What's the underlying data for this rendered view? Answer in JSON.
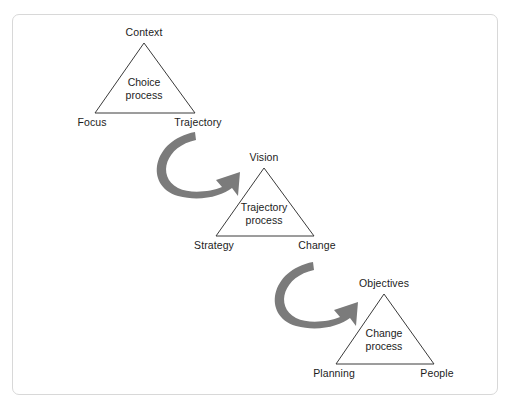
{
  "figure": {
    "background_color": "#ffffff",
    "frame_color": "#d8d8d8",
    "triangle_stroke_color": "#3a3a3a",
    "arrow_color": "#7b7b7b",
    "text_color": "#1c1c1c"
  },
  "diagram": {
    "type": "process-flow-triangles",
    "stages": [
      {
        "id": "choice",
        "inner_label_line1": "Choice",
        "inner_label_line2": "process",
        "apex_label": "Context",
        "bottom_left_label": "Focus",
        "bottom_right_label": "Trajectory",
        "apex": {
          "x": 144,
          "y": 43
        },
        "bottom_left": {
          "x": 95,
          "y": 113
        },
        "bottom_right": {
          "x": 195,
          "y": 113
        }
      },
      {
        "id": "trajectory",
        "inner_label_line1": "Trajectory",
        "inner_label_line2": "process",
        "apex_label": "Vision",
        "bottom_left_label": "Strategy",
        "bottom_right_label": "Change",
        "apex": {
          "x": 264,
          "y": 168
        },
        "bottom_left": {
          "x": 216,
          "y": 236
        },
        "bottom_right": {
          "x": 314,
          "y": 236
        }
      },
      {
        "id": "change",
        "inner_label_line1": "Change",
        "inner_label_line2": "process",
        "apex_label": "Objectives",
        "bottom_left_label": "Planning",
        "bottom_right_label": "People",
        "apex": {
          "x": 384,
          "y": 294
        },
        "bottom_left": {
          "x": 336,
          "y": 364
        },
        "bottom_right": {
          "x": 434,
          "y": 364
        }
      }
    ],
    "connectors": [
      {
        "id": "arrow-choice-to-trajectory",
        "from": "choice",
        "to": "trajectory",
        "shape": "curved-crescent-arrow"
      },
      {
        "id": "arrow-trajectory-to-change",
        "from": "trajectory",
        "to": "change",
        "shape": "curved-crescent-arrow"
      }
    ]
  }
}
